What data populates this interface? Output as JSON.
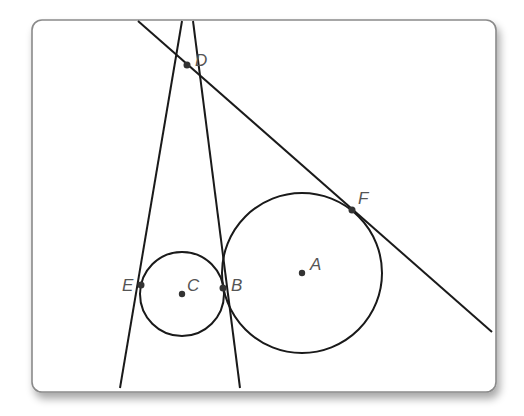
{
  "diagram": {
    "type": "geometry",
    "points": [
      {
        "id": "D",
        "label": "D",
        "role": "intersection of tangent lines"
      },
      {
        "id": "E",
        "label": "E",
        "role": "tangent point on circle C"
      },
      {
        "id": "C",
        "label": "C",
        "role": "center of small circle"
      },
      {
        "id": "B",
        "label": "B",
        "role": "tangent point shared by both circles"
      },
      {
        "id": "A",
        "label": "A",
        "role": "center of large circle"
      },
      {
        "id": "F",
        "label": "F",
        "role": "tangent point on circle A"
      }
    ],
    "circles": [
      {
        "id": "circle-C",
        "center": "C",
        "tangent_points": [
          "E",
          "B"
        ]
      },
      {
        "id": "circle-A",
        "center": "A",
        "tangent_points": [
          "B",
          "F"
        ]
      }
    ],
    "lines": [
      {
        "id": "line-DE",
        "through": [
          "D",
          "E"
        ]
      },
      {
        "id": "line-DB",
        "through": [
          "D",
          "B"
        ]
      },
      {
        "id": "line-DF",
        "through": [
          "D",
          "F"
        ]
      }
    ],
    "colors": {
      "stroke": "#1a1a1a",
      "label": "#555555",
      "point": "#333333",
      "frame": "#8a8a8a"
    }
  }
}
